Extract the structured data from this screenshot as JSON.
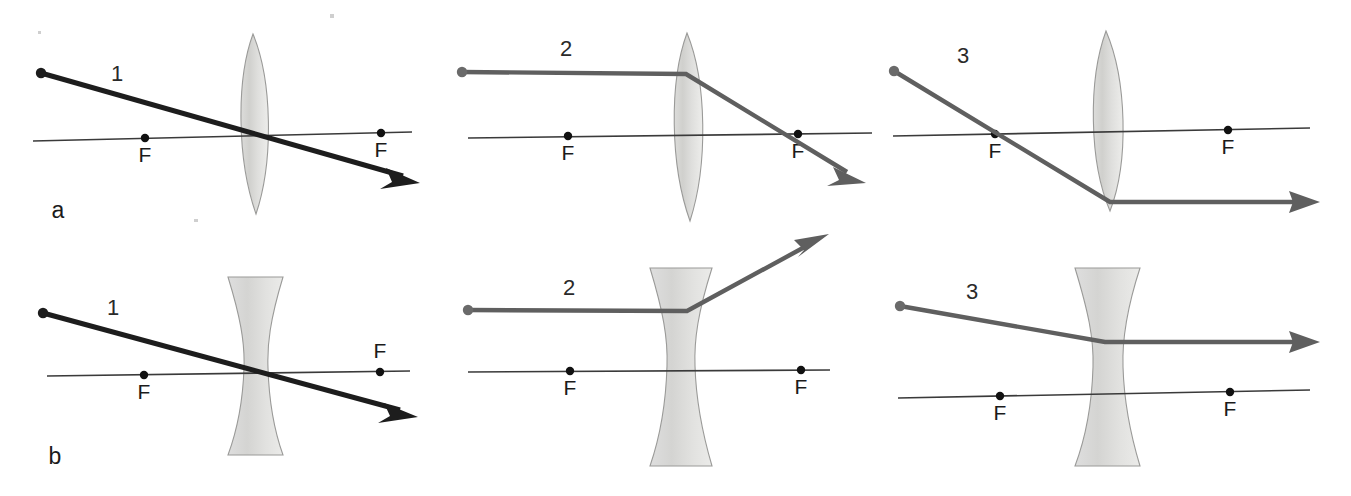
{
  "figure": {
    "title_visible": false,
    "background_color": "#ffffff",
    "width": 1351,
    "height": 496,
    "description_rows": 2,
    "description_cols": 3
  },
  "colors": {
    "ray_dark": "#1d1d1d",
    "ray_gray": "#5f5f5f",
    "axis": "#3a3a3a",
    "lens_fill_light": "#e2e2e0",
    "lens_fill_mid": "#d2d2cf",
    "lens_outline": "#9a9a98",
    "focal_dot": "#111111",
    "text": "#1b1b1b"
  },
  "row_labels": [
    {
      "key": "a",
      "text": "a",
      "lens_type": "converging-biconvex"
    },
    {
      "key": "b",
      "text": "b",
      "lens_type": "diverging-biconcave"
    }
  ],
  "panels": [
    {
      "id": "a1",
      "row": "a",
      "ray_label": "1",
      "lens_type": "converging-biconvex",
      "ray_color": "ray_dark",
      "ray_rule": "ray through center of lens passes undeviated",
      "focal_labels": [
        {
          "text": "F",
          "side": "left",
          "label_position": "below-axis"
        },
        {
          "text": "F",
          "side": "right",
          "label_position": "below-axis"
        }
      ]
    },
    {
      "id": "a2",
      "row": "a",
      "ray_label": "2",
      "lens_type": "converging-biconvex",
      "ray_color": "ray_gray",
      "ray_rule": "ray parallel to axis refracts through far focal point F",
      "focal_labels": [
        {
          "text": "F",
          "side": "left",
          "label_position": "below-axis"
        },
        {
          "text": "F",
          "side": "right",
          "label_position": "below-axis"
        }
      ]
    },
    {
      "id": "a3",
      "row": "a",
      "ray_label": "3",
      "lens_type": "converging-biconvex",
      "ray_color": "ray_gray",
      "ray_rule": "ray through near focal point F emerges parallel to axis",
      "focal_labels": [
        {
          "text": "F",
          "side": "left",
          "label_position": "below-axis"
        },
        {
          "text": "F",
          "side": "right",
          "label_position": "below-axis"
        }
      ]
    },
    {
      "id": "b1",
      "row": "b",
      "ray_label": "1",
      "lens_type": "diverging-biconcave",
      "ray_color": "ray_dark",
      "ray_rule": "ray through center of lens passes undeviated",
      "focal_labels": [
        {
          "text": "F",
          "side": "left",
          "label_position": "below-axis"
        },
        {
          "text": "F",
          "side": "right",
          "label_position": "above-axis"
        }
      ]
    },
    {
      "id": "b2",
      "row": "b",
      "ray_label": "2",
      "lens_type": "diverging-biconcave",
      "ray_color": "ray_gray",
      "ray_rule": "ray parallel to axis diverges as if coming from near focal point F",
      "focal_labels": [
        {
          "text": "F",
          "side": "left",
          "label_position": "below-axis"
        },
        {
          "text": "F",
          "side": "right",
          "label_position": "below-axis"
        }
      ]
    },
    {
      "id": "b3",
      "row": "b",
      "ray_label": "3",
      "lens_type": "diverging-biconcave",
      "ray_color": "ray_gray",
      "ray_rule": "ray aimed at far focal point F emerges parallel to axis",
      "focal_labels": [
        {
          "text": "F",
          "side": "left",
          "label_position": "below-axis"
        },
        {
          "text": "F",
          "side": "right",
          "label_position": "below-axis"
        }
      ]
    }
  ],
  "labels": {
    "a1_ray": "1",
    "a2_ray": "2",
    "a3_ray": "3",
    "b1_ray": "1",
    "b2_ray": "2",
    "b3_ray": "3",
    "row_a": "a",
    "row_b": "b",
    "focal_a1_left": "F",
    "focal_a1_right": "F",
    "focal_a2_left": "F",
    "focal_a2_right": "F",
    "focal_a3_left": "F",
    "focal_a3_right": "F",
    "focal_b1_left": "F",
    "focal_b1_right": "F",
    "focal_b2_left": "F",
    "focal_b2_right": "F",
    "focal_b3_left": "F",
    "focal_b3_right": "F"
  }
}
